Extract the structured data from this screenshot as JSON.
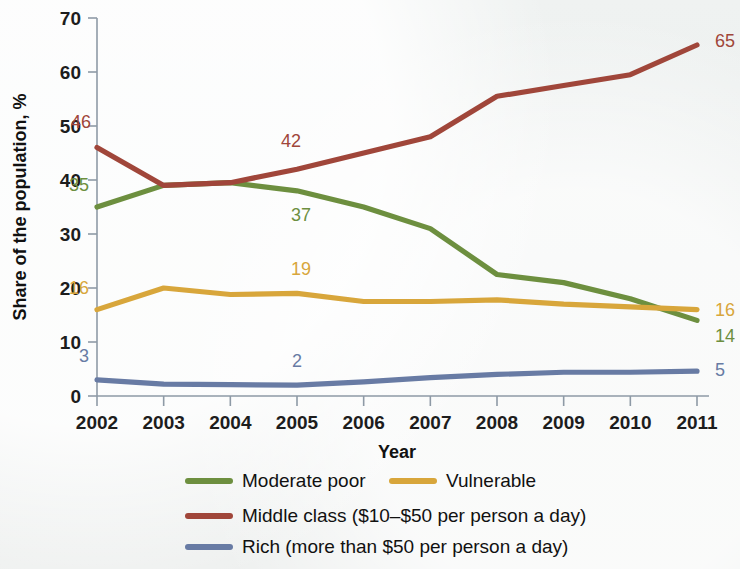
{
  "chart_data": {
    "type": "line",
    "title": "",
    "xlabel": "Year",
    "ylabel": "Share of the population, %",
    "x": [
      2002,
      2003,
      2004,
      2005,
      2006,
      2007,
      2008,
      2009,
      2010,
      2011
    ],
    "categories": [
      "2002",
      "2003",
      "2004",
      "2005",
      "2006",
      "2007",
      "2008",
      "2009",
      "2010",
      "2011"
    ],
    "xlim": [
      2002,
      2011
    ],
    "ylim": [
      0,
      70
    ],
    "yticks": [
      0,
      10,
      20,
      30,
      40,
      50,
      60,
      70
    ],
    "ytick_labels": [
      "0",
      "10",
      "20",
      "30",
      "40",
      "50",
      "60",
      "70"
    ],
    "grid": false,
    "legend_position": "below",
    "series": [
      {
        "name": "Moderate poor",
        "color": "#6d8f3f",
        "values": [
          35,
          39,
          39.5,
          38,
          35,
          31,
          22.5,
          21,
          18,
          14
        ],
        "labels": [
          {
            "x": 2002,
            "value": 35,
            "text": "35"
          },
          {
            "x": 2005,
            "value": 38,
            "text": "37"
          },
          {
            "x": 2011,
            "value": 14,
            "text": "14"
          }
        ]
      },
      {
        "name": "Vulnerable",
        "color": "#d8a63b",
        "values": [
          16,
          20,
          18.8,
          19,
          17.5,
          17.5,
          17.8,
          17,
          16.5,
          16
        ],
        "labels": [
          {
            "x": 2002,
            "value": 16,
            "text": "16"
          },
          {
            "x": 2005,
            "value": 19,
            "text": "19"
          },
          {
            "x": 2011,
            "value": 16,
            "text": "16"
          }
        ]
      },
      {
        "name": "Middle class ($10–$50 per person a day)",
        "color": "#a0463a",
        "values": [
          46,
          39,
          39.5,
          42,
          45,
          48,
          55.5,
          57.5,
          59.5,
          65
        ],
        "labels": [
          {
            "x": 2002,
            "value": 46,
            "text": "46"
          },
          {
            "x": 2005,
            "value": 42,
            "text": "42"
          },
          {
            "x": 2011,
            "value": 65,
            "text": "65"
          }
        ]
      },
      {
        "name": "Rich (more than $50 per person a day)",
        "color": "#687ba4",
        "values": [
          3,
          2.2,
          2.1,
          2,
          2.6,
          3.4,
          4,
          4.4,
          4.4,
          4.6
        ],
        "labels": [
          {
            "x": 2002,
            "value": 3,
            "text": "3"
          },
          {
            "x": 2005,
            "value": 2,
            "text": "2"
          },
          {
            "x": 2011,
            "value": 4.6,
            "text": "5"
          }
        ]
      }
    ]
  },
  "legend": {
    "items": [
      {
        "label": "Moderate poor",
        "color": "#6d8f3f"
      },
      {
        "label": "Vulnerable",
        "color": "#d8a63b"
      },
      {
        "label": "Middle class ($10–$50 per person a day)",
        "color": "#a0463a"
      },
      {
        "label": "Rich (more than $50 per person a day)",
        "color": "#687ba4"
      }
    ]
  }
}
